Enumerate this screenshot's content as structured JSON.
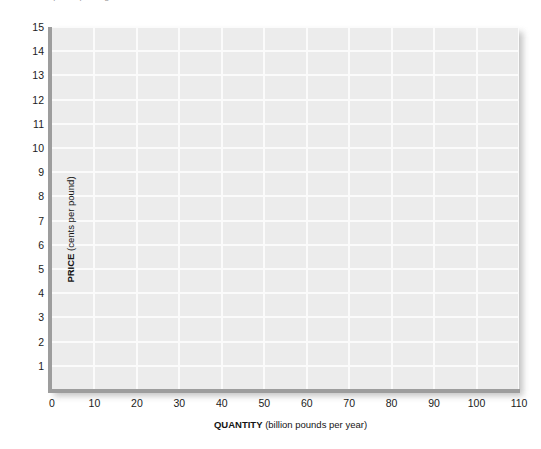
{
  "caption": {
    "text": "Graph for plotting the market"
  },
  "chart_data": {
    "type": "line",
    "title": "",
    "subtitle": "",
    "xlabel_bold": "QUANTITY",
    "xlabel_unit": "(billion pounds per year)",
    "ylabel_bold": "PRICE",
    "ylabel_unit": "(cents per pound)",
    "xlim": [
      0,
      110
    ],
    "ylim": [
      0,
      15
    ],
    "x_ticks": [
      0,
      10,
      20,
      30,
      40,
      50,
      60,
      70,
      80,
      90,
      100,
      110
    ],
    "x_tick_labels": [
      "0",
      "10",
      "20",
      "30",
      "40",
      "50",
      "60",
      "70",
      "80",
      "90",
      "100",
      "110"
    ],
    "y_ticks": [
      1,
      2,
      3,
      4,
      5,
      6,
      7,
      8,
      9,
      10,
      11,
      12,
      13,
      14,
      15
    ],
    "y_tick_labels": [
      "1",
      "2",
      "3",
      "4",
      "5",
      "6",
      "7",
      "8",
      "9",
      "10",
      "11",
      "12",
      "13",
      "14",
      "15"
    ],
    "grid": true,
    "grid_color": "#fbfbfb",
    "plot_background": "#ececec",
    "axis_color": "#9d9d9d",
    "legend": [],
    "series": [],
    "annotations": []
  }
}
